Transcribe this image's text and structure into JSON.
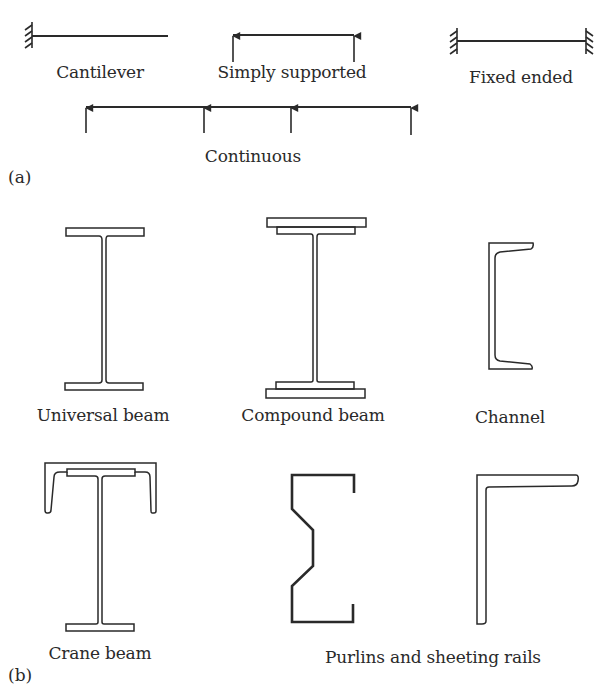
{
  "part_a": {
    "tag": "(a)",
    "labels": {
      "cantilever": "Cantilever",
      "simply_supported": "Simply supported",
      "fixed_ended": "Fixed ended",
      "continuous": "Continuous"
    }
  },
  "part_b": {
    "tag": "(b)",
    "labels": {
      "universal_beam": "Universal beam",
      "compound_beam": "Compound beam",
      "channel": "Channel",
      "crane_beam": "Crane beam",
      "purlins": "Purlins and sheeting rails"
    }
  },
  "colors": {
    "stroke": "#2a2a2a",
    "background": "#ffffff"
  }
}
